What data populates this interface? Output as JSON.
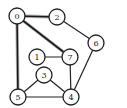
{
  "diagram": {
    "type": "undirected-graph",
    "node_radius": 8,
    "colors": {
      "edge": "#222222",
      "highlight_halo": "#b8b8b8",
      "node_fill": "#ffffff",
      "node_stroke": "#222222",
      "label": "#222222"
    },
    "nodes": [
      {
        "id": "0",
        "label": "0",
        "x": 17,
        "y": 16
      },
      {
        "id": "1",
        "label": "1",
        "x": 37,
        "y": 57
      },
      {
        "id": "2",
        "label": "2",
        "x": 57,
        "y": 17
      },
      {
        "id": "3",
        "label": "3",
        "x": 44,
        "y": 75
      },
      {
        "id": "4",
        "label": "4",
        "x": 71,
        "y": 97
      },
      {
        "id": "5",
        "label": "5",
        "x": 18,
        "y": 97
      },
      {
        "id": "6",
        "label": "6",
        "x": 96,
        "y": 43
      },
      {
        "id": "7",
        "label": "7",
        "x": 70,
        "y": 57
      }
    ],
    "edges": [
      {
        "from": "0",
        "to": "2",
        "highlighted": true
      },
      {
        "from": "0",
        "to": "7",
        "highlighted": true
      },
      {
        "from": "0",
        "to": "5",
        "highlighted": true
      },
      {
        "from": "2",
        "to": "6",
        "highlighted": false
      },
      {
        "from": "6",
        "to": "4",
        "highlighted": false
      },
      {
        "from": "1",
        "to": "7",
        "highlighted": false
      },
      {
        "from": "7",
        "to": "4",
        "highlighted": false
      },
      {
        "from": "3",
        "to": "5",
        "highlighted": false
      },
      {
        "from": "3",
        "to": "4",
        "highlighted": false
      },
      {
        "from": "5",
        "to": "4",
        "highlighted": false
      }
    ]
  }
}
